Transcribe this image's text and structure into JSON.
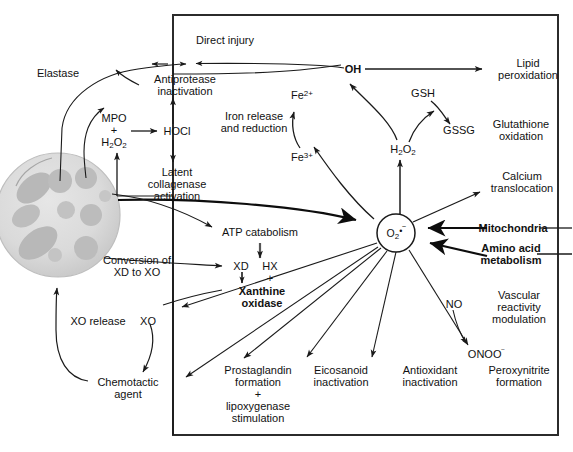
{
  "diagram": {
    "box": {
      "border_color": "#2b2b2b"
    },
    "cell": {
      "name": "neutrophil",
      "fill": "#dcdcdc",
      "granule_fill": "#b4b4b4"
    },
    "colors": {
      "line": "#1a1a1a",
      "text": "#111111",
      "cell_body": "#dcdcdc",
      "cell_granule": "#b4b4b4"
    },
    "nodes": [
      {
        "id": "elastase",
        "label": "Elastase",
        "bold": false
      },
      {
        "id": "antiprotease",
        "label": "Antiprotease\ninactivation",
        "bold": false
      },
      {
        "id": "direct-injury",
        "label": "Direct injury",
        "bold": false
      },
      {
        "id": "mpo-h2o2",
        "label": "MPO\n+\nH2O2",
        "bold": false
      },
      {
        "id": "hocl",
        "label": "HOCl",
        "bold": false
      },
      {
        "id": "latent-collagenase",
        "label": "Latent\ncollagenase\nactivation",
        "bold": false
      },
      {
        "id": "iron-release",
        "label": "Iron release\nand reduction",
        "bold": false
      },
      {
        "id": "fe2",
        "label": "Fe2+",
        "bold": false
      },
      {
        "id": "fe3",
        "label": "Fe3+",
        "bold": false
      },
      {
        "id": "oh-radical",
        "label": "OH",
        "bold": true
      },
      {
        "id": "lipid-peroxidation",
        "label": "Lipid\nperoxidation",
        "bold": false
      },
      {
        "id": "gsh",
        "label": "GSH",
        "bold": false
      },
      {
        "id": "gssg",
        "label": "GSSG",
        "bold": false
      },
      {
        "id": "glutathione-oxidation",
        "label": "Glutathione\noxidation",
        "bold": false
      },
      {
        "id": "h2o2",
        "label": "H2O2",
        "bold": false
      },
      {
        "id": "superoxide",
        "label": "O2-",
        "bold": false
      },
      {
        "id": "calcium-translocation",
        "label": "Calcium\ntranslocation",
        "bold": false
      },
      {
        "id": "mitochondria",
        "label": "Mitochondria",
        "bold": true
      },
      {
        "id": "amino-acid-metabolism",
        "label": "Amino acid\nmetabolism",
        "bold": true
      },
      {
        "id": "atp-catabolism",
        "label": "ATP catabolism",
        "bold": false
      },
      {
        "id": "xd",
        "label": "XD",
        "bold": false
      },
      {
        "id": "hx",
        "label": "HX",
        "bold": false
      },
      {
        "id": "plus-hx",
        "label": "+",
        "bold": false
      },
      {
        "id": "xanthine-oxidase",
        "label": "Xanthine\noxidase",
        "bold": true
      },
      {
        "id": "conversion-xd-xo",
        "label": "Conversion of\nXD to XO",
        "bold": false
      },
      {
        "id": "xo-release",
        "label": "XO release",
        "bold": false
      },
      {
        "id": "xo",
        "label": "XO",
        "bold": false
      },
      {
        "id": "chemotactic-agent",
        "label": "Chemotactic\nagent",
        "bold": false
      },
      {
        "id": "prostaglandin",
        "label": "Prostaglandin\nformation\n+\nlipoxygenase\nstimulation",
        "bold": false
      },
      {
        "id": "eicosanoid",
        "label": "Eicosanoid\ninactivation",
        "bold": false
      },
      {
        "id": "antioxidant",
        "label": "Antioxidant\ninactivation",
        "bold": false
      },
      {
        "id": "no",
        "label": "NO",
        "bold": false
      },
      {
        "id": "onoo",
        "label": "ONOO-",
        "bold": false
      },
      {
        "id": "vascular-reactivity",
        "label": "Vascular\nreactivity\nmodulation",
        "bold": false
      },
      {
        "id": "peroxynitrite",
        "label": "Peroxynitrite\nformation",
        "bold": false
      }
    ],
    "labels": {
      "elastase": "Elastase",
      "antiprotease_line1": "Antiprotease",
      "antiprotease_line2": "inactivation",
      "direct_injury": "Direct injury",
      "mpo": "MPO",
      "plus1": "+",
      "hocl": "HOCl",
      "latent_l1": "Latent",
      "latent_l2": "collagenase",
      "latent_l3": "activation",
      "iron_l1": "Iron release",
      "iron_l2": "and reduction",
      "lipid_l1": "Lipid",
      "lipid_l2": "peroxidation",
      "gsh": "GSH",
      "gssg": "GSSG",
      "glut_l1": "Glutathione",
      "glut_l2": "oxidation",
      "oh": "OH",
      "calcium_l1": "Calcium",
      "calcium_l2": "translocation",
      "mitochondria": "Mitochondria",
      "amino_l1": "Amino acid",
      "amino_l2": "metabolism",
      "atp_catabolism": "ATP catabolism",
      "xd": "XD",
      "hx": "HX",
      "plus2": "+",
      "xanthine_l1": "Xanthine",
      "xanthine_l2": "oxidase",
      "conversion_l1": "Conversion of",
      "conversion_l2": "XD to XO",
      "xo_release": "XO release",
      "xo": "XO",
      "chemo_l1": "Chemotactic",
      "chemo_l2": "agent",
      "prosta_l1": "Prostaglandin",
      "prosta_l2": "formation",
      "prosta_l3": "+",
      "prosta_l4": "lipoxygenase",
      "prosta_l5": "stimulation",
      "eico_l1": "Eicosanoid",
      "eico_l2": "inactivation",
      "antiox_l1": "Antioxidant",
      "antiox_l2": "inactivation",
      "no": "NO",
      "vascular_l1": "Vascular",
      "vascular_l2": "reactivity",
      "vascular_l3": "modulation",
      "peroxy_l1": "Peroxynitrite",
      "peroxy_l2": "formation"
    }
  }
}
